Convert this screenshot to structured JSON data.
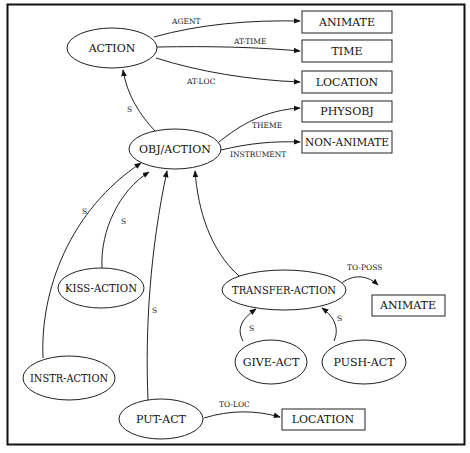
{
  "diagram": {
    "type": "semantic-network",
    "nodes": [
      {
        "id": "action",
        "label": "ACTION",
        "shape": "ellipse",
        "cx": 112,
        "cy": 48,
        "rx": 45,
        "ry": 20
      },
      {
        "id": "animate1",
        "label": "ANIMATE",
        "shape": "box",
        "x": 302,
        "y": 11,
        "w": 90,
        "h": 22
      },
      {
        "id": "time",
        "label": "TIME",
        "shape": "box",
        "x": 302,
        "y": 40,
        "w": 90,
        "h": 22
      },
      {
        "id": "location1",
        "label": "LOCATION",
        "shape": "box",
        "x": 302,
        "y": 71,
        "w": 90,
        "h": 22
      },
      {
        "id": "physobj",
        "label": "PHYSOBJ",
        "shape": "box",
        "x": 302,
        "y": 101,
        "w": 90,
        "h": 21
      },
      {
        "id": "nonanimate",
        "label": "NON-ANIMATE",
        "shape": "box",
        "x": 302,
        "y": 131,
        "w": 90,
        "h": 22
      },
      {
        "id": "objaction",
        "label": "OBJ/ACTION",
        "shape": "ellipse",
        "cx": 175,
        "cy": 149,
        "rx": 46,
        "ry": 20
      },
      {
        "id": "kissaction",
        "label": "KISS-ACTION",
        "shape": "ellipse",
        "cx": 101,
        "cy": 288,
        "rx": 43,
        "ry": 20
      },
      {
        "id": "transferaction",
        "label": "TRANSFER-ACTION",
        "shape": "ellipse",
        "cx": 284,
        "cy": 290,
        "rx": 62,
        "ry": 20
      },
      {
        "id": "animate2",
        "label": "ANIMATE",
        "shape": "box",
        "x": 372,
        "y": 295,
        "w": 73,
        "h": 21
      },
      {
        "id": "giveact",
        "label": "GIVE-ACT",
        "shape": "ellipse",
        "cx": 271,
        "cy": 362,
        "rx": 36,
        "ry": 22
      },
      {
        "id": "pushact",
        "label": "PUSH-ACT",
        "shape": "ellipse",
        "cx": 364,
        "cy": 362,
        "rx": 42,
        "ry": 22
      },
      {
        "id": "instraction",
        "label": "INSTR-ACTION",
        "shape": "ellipse",
        "cx": 69,
        "cy": 378,
        "rx": 46,
        "ry": 22
      },
      {
        "id": "putact",
        "label": "PUT-ACT",
        "shape": "ellipse",
        "cx": 161,
        "cy": 419,
        "rx": 42,
        "ry": 20
      },
      {
        "id": "location2",
        "label": "LOCATION",
        "shape": "box",
        "x": 282,
        "y": 409,
        "w": 83,
        "h": 21
      }
    ],
    "edges": [
      {
        "from": "action",
        "to": "animate1",
        "label": "AGENT"
      },
      {
        "from": "action",
        "to": "time",
        "label": "AT-TIME"
      },
      {
        "from": "action",
        "to": "location1",
        "label": "AT-LOC"
      },
      {
        "from": "objaction",
        "to": "action",
        "label": "S"
      },
      {
        "from": "objaction",
        "to": "physobj",
        "label": "THEME"
      },
      {
        "from": "objaction",
        "to": "nonanimate",
        "label": "INSTRUMENT"
      },
      {
        "from": "instraction",
        "to": "objaction",
        "label": "S"
      },
      {
        "from": "kissaction",
        "to": "objaction",
        "label": "S"
      },
      {
        "from": "putact",
        "to": "objaction",
        "label": "S"
      },
      {
        "from": "transferaction",
        "to": "objaction",
        "label": ""
      },
      {
        "from": "transferaction",
        "to": "animate2",
        "label": "TO-POSS"
      },
      {
        "from": "giveact",
        "to": "transferaction",
        "label": "S"
      },
      {
        "from": "pushact",
        "to": "transferaction",
        "label": "S"
      },
      {
        "from": "putact",
        "to": "location2",
        "label": "TO-LOC"
      }
    ]
  },
  "labels": {
    "action": "ACTION",
    "animate1": "ANIMATE",
    "time": "TIME",
    "location1": "LOCATION",
    "physobj": "PHYSOBJ",
    "nonanimate": "NON-ANIMATE",
    "objaction": "OBJ/ACTION",
    "kissaction": "KISS-ACTION",
    "transferaction": "TRANSFER-ACTION",
    "animate2": "ANIMATE",
    "giveact": "GIVE-ACT",
    "pushact": "PUSH-ACT",
    "instraction": "INSTR-ACTION",
    "putact": "PUT-ACT",
    "location2": "LOCATION",
    "edge_agent": "AGENT",
    "edge_at_time": "AT-TIME",
    "edge_at_loc": "AT-LOC",
    "edge_s_objaction_action": "S",
    "edge_theme": "THEME",
    "edge_instrument": "INSTRUMENT",
    "edge_s_instr": "S",
    "edge_s_kiss": "S",
    "edge_s_put": "S",
    "edge_to_poss": "TO-POSS",
    "edge_s_give": "S",
    "edge_s_push": "S",
    "edge_to_loc": "TO-LOC"
  }
}
